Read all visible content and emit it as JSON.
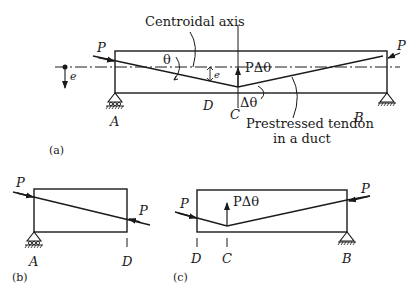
{
  "figure_a": {
    "caption": "(a)",
    "centroidal_axis_label": "Centroidal axis",
    "tendon_label_line1": "Prestressed tendon",
    "tendon_label_line2": "in a duct",
    "force_left": "P",
    "force_right": "P",
    "eccentricity_left": "e",
    "eccentricity_mid": "e",
    "angle": "θ",
    "upward_force": "PΔθ",
    "angle_change": "Δθ",
    "support_left": "A",
    "support_right": "B",
    "point_d": "D",
    "point_c": "C"
  },
  "figure_b": {
    "caption": "(b)",
    "force_left": "P",
    "force_right": "P",
    "support_left": "A",
    "point_d": "D"
  },
  "figure_c": {
    "caption": "(c)",
    "force_left": "P",
    "force_right": "P",
    "upward_force": "PΔθ",
    "point_d": "D",
    "point_c": "C",
    "support_right": "B"
  },
  "colors": {
    "ink": "#1a1a1a",
    "background": "#ffffff"
  }
}
